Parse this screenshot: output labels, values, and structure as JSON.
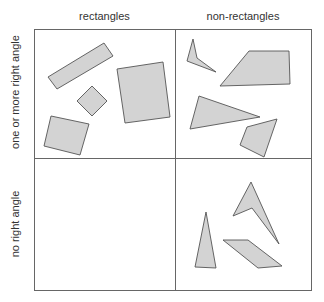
{
  "columns": [
    {
      "label": "rectangles"
    },
    {
      "label": "non-rectangles"
    }
  ],
  "rows": [
    {
      "label": "one or more right angle"
    },
    {
      "label": "no right angle"
    }
  ],
  "colors": {
    "shape_fill": "#d3d3d3",
    "shape_stroke": "#555555",
    "grid": "#666666"
  },
  "cells": {
    "rectangles_right_angle": {
      "shape_count": 4
    },
    "nonrect_right_angle": {
      "shape_count": 4
    },
    "rectangles_no_right_angle": {
      "shape_count": 0
    },
    "nonrect_no_right_angle": {
      "shape_count": 3
    }
  }
}
